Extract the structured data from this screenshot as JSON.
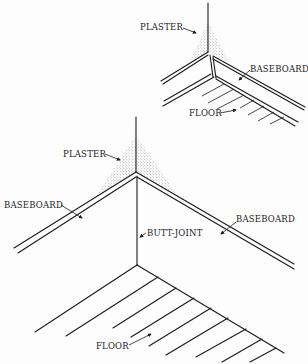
{
  "figure": {
    "top_detail": {
      "labels": {
        "plaster": "PLASTER",
        "baseboard": "BASEBOARD",
        "floor": "FLOOR"
      }
    },
    "main_detail": {
      "labels": {
        "plaster": "PLASTER",
        "baseboard_left": "BASEBOARD",
        "baseboard_right": "BASEBOARD",
        "butt_joint": "BUTT-JOINT",
        "floor": "FLOOR"
      }
    },
    "colors": {
      "line": "#1a1a1a",
      "background": "#fdfdfd",
      "stipple": "#555555"
    }
  }
}
